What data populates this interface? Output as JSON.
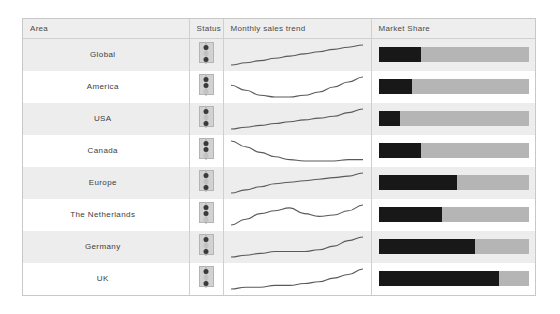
{
  "header": {
    "columns": [
      {
        "key": "area",
        "label": "Area"
      },
      {
        "key": "status",
        "label": "Status"
      },
      {
        "key": "trend",
        "label": "Monthly sales trend"
      },
      {
        "key": "share",
        "label": "Market Share"
      }
    ]
  },
  "colors": {
    "own_share": "#181818",
    "rest_share": "#b5b5b5",
    "sparkline": "#5a5a5a",
    "header_bg": "#eeeeee",
    "row_odd_bg": "#ededed",
    "row_even_bg": "#ffffff",
    "border": "#c8c8c8"
  },
  "rows": [
    {
      "area": "Global",
      "status": "green",
      "status_icon": "traffic-light-icon",
      "share_pct": 28,
      "rest_pct": 100,
      "trend": [
        14,
        13,
        12,
        11,
        10,
        9,
        8,
        7,
        6,
        5
      ]
    },
    {
      "area": "America",
      "status": "yellow",
      "status_icon": "traffic-light-icon",
      "share_pct": 22,
      "rest_pct": 100,
      "trend": [
        9,
        12,
        15,
        16,
        16,
        15,
        13,
        10,
        7,
        4
      ]
    },
    {
      "area": "USA",
      "status": "green",
      "status_icon": "traffic-light-icon",
      "share_pct": 14,
      "rest_pct": 100,
      "trend": [
        15,
        14,
        13,
        12,
        11,
        10,
        9,
        8,
        6,
        4
      ]
    },
    {
      "area": "Canada",
      "status": "yellow",
      "status_icon": "traffic-light-icon",
      "share_pct": 28,
      "rest_pct": 100,
      "trend": [
        3,
        7,
        11,
        14,
        16,
        17,
        17,
        17,
        16,
        16
      ]
    },
    {
      "area": "Europe",
      "status": "green",
      "status_icon": "traffic-light-icon",
      "share_pct": 52,
      "rest_pct": 100,
      "trend": [
        16,
        14,
        12,
        10,
        9,
        8,
        7,
        6,
        5,
        3
      ]
    },
    {
      "area": "The Netherlands",
      "status": "yellow",
      "status_icon": "traffic-light-icon",
      "share_pct": 42,
      "rest_pct": 100,
      "trend": [
        18,
        14,
        10,
        8,
        6,
        10,
        12,
        11,
        8,
        4
      ]
    },
    {
      "area": "Germany",
      "status": "green",
      "status_icon": "traffic-light-icon",
      "share_pct": 64,
      "rest_pct": 100,
      "trend": [
        15,
        14,
        13,
        12,
        12,
        12,
        11,
        9,
        6,
        4
      ]
    },
    {
      "area": "UK",
      "status": "green",
      "status_icon": "traffic-light-icon",
      "share_pct": 80,
      "rest_pct": 100,
      "trend": [
        16,
        15,
        15,
        14,
        14,
        13,
        12,
        10,
        8,
        5
      ]
    }
  ],
  "chart_data": {
    "type": "table",
    "columns": [
      "Area",
      "Status",
      "Monthly sales trend",
      "Market Share"
    ],
    "categories": [
      "Global",
      "America",
      "USA",
      "Canada",
      "Europe",
      "The Netherlands",
      "Germany",
      "UK"
    ],
    "series": [
      {
        "name": "Market Share (own, %)",
        "type": "bar",
        "values": [
          28,
          22,
          14,
          28,
          52,
          42,
          64,
          80
        ],
        "xlim": [
          0,
          100
        ]
      },
      {
        "name": "Status (traffic light)",
        "type": "categorical",
        "values": [
          "green",
          "yellow",
          "green",
          "yellow",
          "green",
          "yellow",
          "green",
          "green"
        ]
      }
    ],
    "sparklines": [
      {
        "name": "Global",
        "type": "line",
        "values": [
          1,
          2,
          3,
          4,
          5,
          6,
          7,
          8,
          9,
          10
        ],
        "direction": "rising"
      },
      {
        "name": "America",
        "type": "line",
        "values": [
          6,
          4,
          2,
          1,
          1,
          2,
          4,
          7,
          10,
          12
        ],
        "direction": "dip-then-rise"
      },
      {
        "name": "USA",
        "type": "line",
        "values": [
          1,
          2,
          3,
          4,
          5,
          6,
          7,
          8,
          10,
          12
        ],
        "direction": "rising"
      },
      {
        "name": "Canada",
        "type": "line",
        "values": [
          13,
          9,
          5,
          2,
          1,
          0,
          0,
          0,
          1,
          1
        ],
        "direction": "falling-then-flat"
      },
      {
        "name": "The Netherlands",
        "type": "line",
        "values": [
          0,
          4,
          8,
          10,
          12,
          8,
          6,
          7,
          10,
          14
        ],
        "direction": "rise-dip-rise"
      },
      {
        "name": "Europe",
        "type": "line",
        "values": [
          0,
          2,
          4,
          6,
          7,
          8,
          9,
          10,
          11,
          13
        ],
        "direction": "rising"
      },
      {
        "name": "Germany",
        "type": "line",
        "values": [
          1,
          2,
          3,
          4,
          4,
          4,
          5,
          7,
          10,
          12
        ],
        "direction": "flat-then-rising"
      },
      {
        "name": "UK",
        "type": "line",
        "values": [
          0,
          1,
          1,
          2,
          2,
          3,
          4,
          6,
          8,
          11
        ],
        "direction": "gently-rising"
      }
    ],
    "xlabel": "",
    "ylabel": "",
    "grid": false,
    "legend": "none"
  }
}
